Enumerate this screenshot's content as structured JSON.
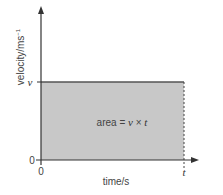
{
  "diagram": {
    "type": "velocity-time graph",
    "y_axis_label": "velocity/ms",
    "y_axis_label_sup": "−1",
    "x_axis_label": "time/s",
    "y_tick_v": "v",
    "y_tick_0": "0",
    "x_tick_0": "0",
    "x_tick_t": "t",
    "area_label_prefix": "area = ",
    "area_label_v": "v",
    "area_label_times": " × ",
    "area_label_t": "t",
    "colors": {
      "axis": "#333333",
      "fill": "#c8c8c8",
      "top_line": "#555555",
      "dashed": "#444444"
    }
  }
}
